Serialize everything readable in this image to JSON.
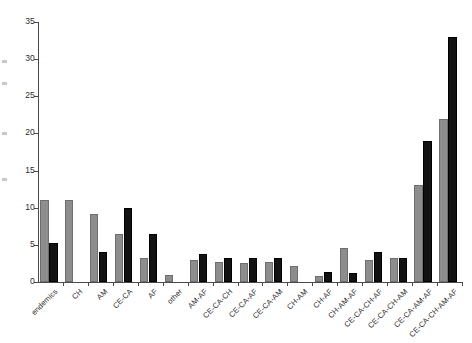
{
  "chart_data": {
    "type": "bar",
    "title": "",
    "subtitle": "",
    "xlabel": "",
    "ylabel": "",
    "ylim": [
      0,
      35
    ],
    "yticks": [
      0,
      5,
      10,
      15,
      20,
      25,
      30,
      35
    ],
    "grid": false,
    "legend": "none",
    "categories": [
      "endemics",
      "CH",
      "AM",
      "CE-CA",
      "AF",
      "other",
      "AM-AF",
      "CE-CA-CH",
      "CE-CA-AF",
      "CE-CA-AM",
      "CH-AM",
      "CH-AF",
      "CH-AM-AF",
      "CE-CA-CH-AF",
      "CE-CA-CH-AM",
      "CE-CA-AM-AF",
      "CE-CA-CH-AM-AF"
    ],
    "series": [
      {
        "name": "series-a",
        "color": "#8d8d8d",
        "values": [
          11,
          11,
          9.2,
          6.5,
          3.3,
          1.0,
          3.0,
          2.7,
          2.6,
          2.7,
          2.2,
          0.8,
          4.6,
          3.0,
          3.2,
          13,
          22
        ]
      },
      {
        "name": "series-b",
        "color": "#121212",
        "values": [
          5.2,
          0,
          4.0,
          10.0,
          6.5,
          0,
          3.8,
          3.3,
          3.3,
          3.2,
          0,
          1.3,
          1.2,
          4.0,
          3.3,
          19,
          33
        ]
      }
    ]
  }
}
